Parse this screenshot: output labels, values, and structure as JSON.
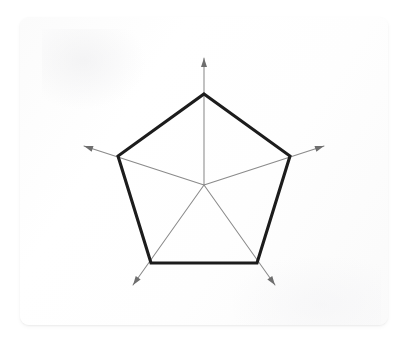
{
  "figure": {
    "kind": "radar-chart-diagram",
    "background_color": "#ffffff",
    "card": {
      "fill_color": "#fdfdfd",
      "border_radius": 9,
      "x": 20,
      "y": 17,
      "width": 368,
      "height": 308
    }
  },
  "chart_data": {
    "type": "radar",
    "title": "",
    "subtitle": "",
    "xlabel": "",
    "ylabel": "",
    "grid": false,
    "legend": "none",
    "axis_count": 5,
    "axis_labels": [
      "",
      "",
      "",
      "",
      ""
    ],
    "tick_labels": [],
    "rlim": [
      0,
      1
    ],
    "center": {
      "x": 204,
      "y": 185
    },
    "radius": 91,
    "axis_arrow_overshoot": 36,
    "axis_angles_deg": [
      90,
      18,
      306,
      234,
      162
    ],
    "series": [
      {
        "name": "",
        "values": [
          1,
          1,
          1,
          1,
          1
        ],
        "stroke_color": "#1c1c1c",
        "stroke_width": 3.1,
        "fill": "none"
      }
    ],
    "axes_style": {
      "stroke_color": "#8a8a8a",
      "stroke_width": 1.05,
      "arrowhead_color": "#6e6e6e",
      "arrowhead_length": 9,
      "arrowhead_width": 6
    },
    "polygon_vertices": [
      {
        "x": 204,
        "y": 94
      },
      {
        "x": 290,
        "y": 156
      },
      {
        "x": 257,
        "y": 263
      },
      {
        "x": 151,
        "y": 263
      },
      {
        "x": 118,
        "y": 156
      }
    ],
    "arrow_tips": [
      {
        "x": 204,
        "y": 58
      },
      {
        "x": 324,
        "y": 146
      },
      {
        "x": 275,
        "y": 285
      },
      {
        "x": 133,
        "y": 285
      },
      {
        "x": 84,
        "y": 146
      }
    ]
  }
}
